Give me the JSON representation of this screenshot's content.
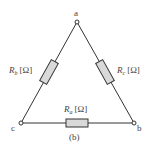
{
  "diagram": {
    "type": "delta-resistor-network",
    "caption": "(b)",
    "nodes": [
      {
        "id": "a",
        "label": "a",
        "x": 77,
        "y": 22
      },
      {
        "id": "b",
        "label": "b",
        "x": 134,
        "y": 123
      },
      {
        "id": "c",
        "label": "c",
        "x": 21,
        "y": 123
      }
    ],
    "resistors": [
      {
        "id": "Rb",
        "symbol": "R",
        "sub": "b",
        "unit": "[Ω]",
        "between": [
          "a",
          "c"
        ]
      },
      {
        "id": "Rc",
        "symbol": "R",
        "sub": "c",
        "unit": "[Ω]",
        "between": [
          "a",
          "b"
        ]
      },
      {
        "id": "Ra",
        "symbol": "R",
        "sub": "a",
        "unit": "[Ω]",
        "between": [
          "c",
          "b"
        ]
      }
    ],
    "colors": {
      "line": "#333333",
      "resistor_fill": "#d9d9d9",
      "text": "#444444"
    }
  }
}
